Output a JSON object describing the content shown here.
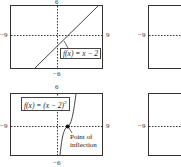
{
  "panels": [
    {
      "id": "top-left",
      "function_label": "f(x) = x − 2",
      "xmin_label": "−9",
      "xmax_label": "9",
      "ymax_label": "6",
      "ymin_label": "−6"
    },
    {
      "id": "bottom-left",
      "function_label": "f(x) = (x − 2)",
      "exponent": "3",
      "xmin_label": "−9",
      "xmax_label": "9",
      "ymax_label": "6",
      "ymin_label": "−6",
      "annotation_line1": "Point of",
      "annotation_line2": "inflection"
    },
    {
      "id": "top-right",
      "xmin_label": "−9"
    },
    {
      "id": "bottom-right",
      "xmin_label": "−9"
    }
  ],
  "colors": {
    "frame": "#333333",
    "curve": "#444444",
    "point": "#111111"
  }
}
